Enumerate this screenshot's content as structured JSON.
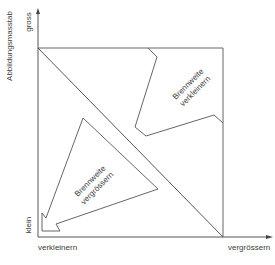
{
  "diagram": {
    "y_axis": {
      "title": "Abbildungsmasstab",
      "top_label": "gross",
      "bottom_label": "klein"
    },
    "x_axis": {
      "left_label": "verkleinern",
      "right_label": "vergrössern"
    },
    "regions": [
      {
        "line1": "Brennweite",
        "line2": "verkleinern"
      },
      {
        "line1": "Brennweite",
        "line2": "vergrössern"
      }
    ],
    "colors": {
      "line": "#555555",
      "text": "#3a3a3a",
      "background": "#ffffff"
    }
  }
}
